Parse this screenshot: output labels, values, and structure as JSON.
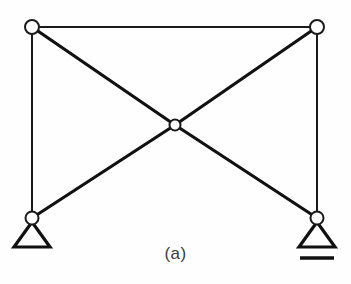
{
  "figure": {
    "caption": "(a)",
    "type": "structural-truss-diagram",
    "colors": {
      "background": "#fefefe",
      "member": "#111111",
      "joint_fill": "#ffffff",
      "joint_stroke": "#1a1a1a",
      "caption_text": "#3a3a3a"
    },
    "canvas": {
      "width": 351,
      "height": 284
    }
  },
  "joints": [
    {
      "id": "top-left",
      "label": "top-left-joint",
      "x": 32,
      "y": 27,
      "r": 7.0
    },
    {
      "id": "top-right",
      "label": "top-right-joint",
      "x": 317,
      "y": 27,
      "r": 7.0
    },
    {
      "id": "center",
      "label": "center-joint",
      "x": 175,
      "y": 125,
      "r": 5.5
    },
    {
      "id": "bottom-left",
      "label": "bottom-left-joint",
      "x": 32,
      "y": 218,
      "r": 6.5
    },
    {
      "id": "bottom-right",
      "label": "bottom-right-joint",
      "x": 317,
      "y": 218,
      "r": 6.5
    }
  ],
  "members": [
    {
      "id": "top-chord",
      "from": "top-left",
      "to": "top-right",
      "weight": "thin",
      "x1": 32,
      "y1": 27,
      "x2": 317,
      "y2": 27
    },
    {
      "id": "left-vertical",
      "from": "top-left",
      "to": "bottom-left",
      "weight": "thin",
      "x1": 32,
      "y1": 27,
      "x2": 32,
      "y2": 218
    },
    {
      "id": "right-vertical",
      "from": "top-right",
      "to": "bottom-right",
      "weight": "thin",
      "x1": 317,
      "y1": 27,
      "x2": 317,
      "y2": 218
    },
    {
      "id": "diagonal-tl-center",
      "from": "top-left",
      "to": "center",
      "weight": "thick",
      "x1": 32,
      "y1": 27,
      "x2": 175,
      "y2": 125
    },
    {
      "id": "diagonal-tr-center",
      "from": "top-right",
      "to": "center",
      "weight": "thick",
      "x1": 317,
      "y1": 27,
      "x2": 175,
      "y2": 125
    },
    {
      "id": "diagonal-bl-center",
      "from": "bottom-left",
      "to": "center",
      "weight": "thick",
      "x1": 32,
      "y1": 218,
      "x2": 175,
      "y2": 125
    },
    {
      "id": "diagonal-br-center",
      "from": "bottom-right",
      "to": "center",
      "weight": "thick",
      "x1": 317,
      "y1": 218,
      "x2": 175,
      "y2": 125
    }
  ],
  "supports": [
    {
      "id": "pin-support-left",
      "kind": "pin",
      "at_joint": "bottom-left",
      "triangle": {
        "apex_x": 32,
        "apex_y": 222,
        "left_x": 14,
        "right_x": 50,
        "base_y": 247
      },
      "has_ground_line": false
    },
    {
      "id": "roller-support-right",
      "kind": "roller",
      "at_joint": "bottom-right",
      "triangle": {
        "apex_x": 317,
        "apex_y": 222,
        "left_x": 299,
        "right_x": 335,
        "base_y": 247
      },
      "has_ground_line": true,
      "ground_line": {
        "x1": 300,
        "y1": 258,
        "x2": 334,
        "y2": 258
      }
    }
  ]
}
